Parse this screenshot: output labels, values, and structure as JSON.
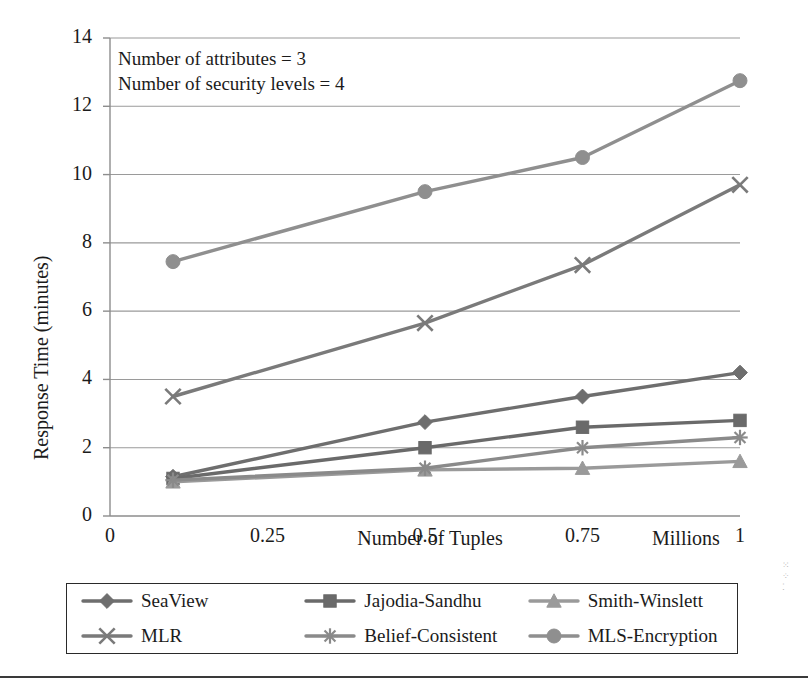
{
  "chart_data": {
    "type": "line",
    "title": "",
    "xlabel": "Number of Tuples",
    "xunits": "Millions",
    "ylabel": "Response Time (minutes)",
    "x": [
      0.1,
      0.5,
      0.75,
      1
    ],
    "xlim": [
      0,
      1
    ],
    "ylim": [
      0,
      14
    ],
    "xticks": [
      "0",
      "0.25",
      "0.5",
      "0.75",
      "1"
    ],
    "xtick_values": [
      0,
      0.25,
      0.5,
      0.75,
      1
    ],
    "yticks": [
      "0",
      "2",
      "4",
      "6",
      "8",
      "10",
      "12",
      "14"
    ],
    "ytick_values": [
      0,
      2,
      4,
      6,
      8,
      10,
      12,
      14
    ],
    "grid": "horizontal",
    "legend_position": "below",
    "annotations": [
      "Number of attributes = 3",
      "Number of security levels = 4"
    ],
    "series": [
      {
        "name": "SeaView",
        "marker": "diamond",
        "color": "#6e6e6e",
        "values": [
          1.15,
          2.75,
          3.5,
          4.2
        ]
      },
      {
        "name": "Jajodia-Sandhu",
        "marker": "square",
        "color": "#6a6a6a",
        "values": [
          1.1,
          2.0,
          2.6,
          2.8
        ]
      },
      {
        "name": "Smith-Winslett",
        "marker": "triangle",
        "color": "#9a9a9a",
        "values": [
          1.0,
          1.35,
          1.4,
          1.6
        ]
      },
      {
        "name": "MLR",
        "marker": "cross",
        "color": "#7a7a7a",
        "values": [
          3.5,
          5.65,
          7.35,
          9.7
        ]
      },
      {
        "name": "Belief-Consistent",
        "marker": "star",
        "color": "#8a8a8a",
        "values": [
          1.05,
          1.4,
          2.0,
          2.3
        ]
      },
      {
        "name": "MLS-Encryption",
        "marker": "circle",
        "color": "#8f8f8f",
        "values": [
          7.45,
          9.5,
          10.5,
          12.75
        ]
      }
    ]
  },
  "legend": {
    "items": [
      {
        "label": "SeaView",
        "marker": "diamond",
        "color": "#6e6e6e"
      },
      {
        "label": "Jajodia-Sandhu",
        "marker": "square",
        "color": "#6a6a6a"
      },
      {
        "label": "Smith-Winslett",
        "marker": "triangle",
        "color": "#9a9a9a"
      },
      {
        "label": "MLR",
        "marker": "cross",
        "color": "#7a7a7a"
      },
      {
        "label": "Belief-Consistent",
        "marker": "star",
        "color": "#8a8a8a"
      },
      {
        "label": "MLS-Encryption",
        "marker": "circle",
        "color": "#8f8f8f"
      }
    ]
  },
  "style": {
    "axis_color": "#8d8d8d",
    "grid_color": "#9a9a9a",
    "text_color": "#1b1b1b",
    "background": "#ffffff"
  }
}
